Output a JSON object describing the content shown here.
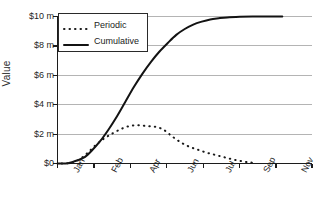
{
  "chart_data": {
    "type": "line",
    "title": "",
    "xlabel": "",
    "ylabel": "Value",
    "grid": true,
    "legend_position": "upper-left-inside",
    "x_tick_labels": [
      "Jan",
      "Feb",
      "Apr",
      "Jun",
      "Jul",
      "Sep",
      "Nov"
    ],
    "y_tick_labels": [
      "$0",
      "$2 m",
      "$4 m",
      "$6 m",
      "$8 m",
      "$10 m"
    ],
    "y_tick_values": [
      0,
      2,
      4,
      6,
      8,
      10
    ],
    "ylim": [
      0,
      10
    ],
    "xlim": [
      0,
      12
    ],
    "x_months": [
      "Jan",
      "Feb",
      "Mar",
      "Apr",
      "May",
      "Jun",
      "Jul",
      "Aug",
      "Sep",
      "Oct",
      "Nov",
      "Dec"
    ],
    "series": [
      {
        "name": "Periodic",
        "style": "dotted",
        "color": "#1a1a1a",
        "x": [
          0.2,
          0.6,
          1.0,
          1.4,
          1.8,
          2.2,
          2.6,
          3.0,
          3.4,
          3.8,
          4.2,
          4.6,
          5.0,
          5.4,
          5.8,
          6.2,
          6.6,
          7.0,
          7.4,
          7.8,
          8.2,
          8.6,
          9.0,
          9.4
        ],
        "values": [
          0.0,
          0.05,
          0.25,
          0.7,
          1.25,
          1.7,
          2.05,
          2.35,
          2.55,
          2.6,
          2.55,
          2.5,
          2.3,
          1.85,
          1.45,
          1.15,
          0.95,
          0.75,
          0.6,
          0.45,
          0.3,
          0.18,
          0.08,
          0.04
        ]
      },
      {
        "name": "Cumulative",
        "style": "solid",
        "color": "#131313",
        "x": [
          0.0,
          0.5,
          1.0,
          1.3,
          1.6,
          2.0,
          2.4,
          2.8,
          3.2,
          3.6,
          4.0,
          4.4,
          4.8,
          5.2,
          5.6,
          6.0,
          6.4,
          6.8,
          7.2,
          7.6,
          8.0,
          8.6,
          9.2,
          10.0,
          10.6
        ],
        "values": [
          0.0,
          0.02,
          0.25,
          0.45,
          0.85,
          1.5,
          2.3,
          3.2,
          4.2,
          5.2,
          6.1,
          6.9,
          7.6,
          8.2,
          8.75,
          9.15,
          9.45,
          9.65,
          9.8,
          9.88,
          9.94,
          9.98,
          10.0,
          10.0,
          10.0
        ]
      }
    ]
  },
  "legend": {
    "items": [
      {
        "label": "Periodic"
      },
      {
        "label": "Cumulative"
      }
    ]
  },
  "axes": {
    "y_label": "Value"
  }
}
